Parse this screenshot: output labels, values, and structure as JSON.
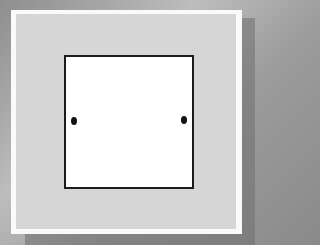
{
  "scene": {
    "subject": "wall plate with square opening and two screw holes",
    "colors": {
      "background": "#9e9e9e",
      "plate_border": "#fafafa",
      "plate_fill": "#d6d6d6",
      "opening_fill": "#ffffff",
      "opening_outline": "#1c1c1c",
      "screw": "#111111"
    },
    "screws": [
      {
        "position": "left"
      },
      {
        "position": "right"
      }
    ]
  }
}
